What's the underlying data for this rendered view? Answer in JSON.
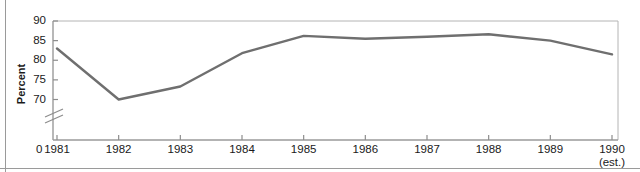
{
  "chart_data": {
    "type": "line",
    "title": "",
    "subtitle": "",
    "xlabel": "",
    "ylabel": "Percent",
    "categories": [
      "1981",
      "1982",
      "1983",
      "1984",
      "1985",
      "1986",
      "1987",
      "1988",
      "1989",
      "1990"
    ],
    "values": [
      83.0,
      70.0,
      73.3,
      81.8,
      86.2,
      85.5,
      86.0,
      86.6,
      85.0,
      81.5
    ],
    "series": [
      {
        "name": "Percent",
        "values": [
          83.0,
          70.0,
          73.3,
          81.8,
          86.2,
          85.5,
          86.0,
          86.6,
          85.0,
          81.5
        ]
      }
    ],
    "ylim": [
      70,
      90
    ],
    "yticks": [
      70,
      75,
      80,
      85,
      90
    ],
    "ytick_labels": [
      "70",
      "75",
      "80",
      "85",
      "90"
    ],
    "xtick_labels": [
      "1981",
      "1982",
      "1983",
      "1984",
      "1985",
      "1986",
      "1987",
      "1988",
      "1989",
      "1990"
    ],
    "axis_break": true,
    "axis_origin_label": "0",
    "last_point_note": "(est.)",
    "grid": false,
    "legend": "none",
    "line_color": "#6f6f6f",
    "frame_color": "#b4b4b4",
    "text_color": "#1a1a1a"
  },
  "axes": {
    "y_axis_title": "Percent",
    "origin_label": "0",
    "estimate_note": "(est.)"
  }
}
